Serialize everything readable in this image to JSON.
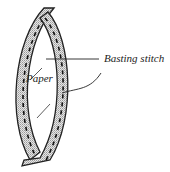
{
  "diagram": {
    "type": "sewing-illustration",
    "labels": {
      "paper": "Paper",
      "basting_stitch": "Basting stitch"
    },
    "colors": {
      "stroke": "#222222",
      "fabric_fill": "#cfcfcf",
      "background": "#ffffff"
    }
  }
}
